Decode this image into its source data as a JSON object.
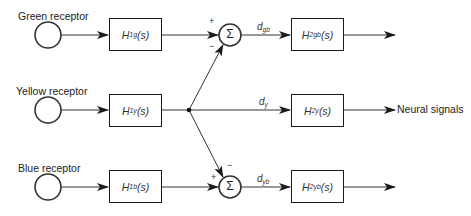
{
  "diagram": {
    "type": "block-diagram",
    "receptors": [
      {
        "label": "Green receptor"
      },
      {
        "label": "Yellow receptor"
      },
      {
        "label": "Blue receptor"
      }
    ],
    "stage1_blocks": [
      {
        "symbol": "H",
        "sub": "1g",
        "arg": "(s)"
      },
      {
        "symbol": "H",
        "sub": "1y",
        "arg": "(s)"
      },
      {
        "symbol": "H",
        "sub": "1b",
        "arg": "(s)"
      }
    ],
    "summing_junctions": [
      {
        "symbol": "Σ",
        "plus": "+",
        "minus": "−"
      },
      {
        "symbol": "Σ",
        "plus": "+",
        "minus": "−"
      }
    ],
    "signals": [
      {
        "symbol": "d",
        "sub": "gb"
      },
      {
        "symbol": "d",
        "sub": "y"
      },
      {
        "symbol": "d",
        "sub": "yb"
      }
    ],
    "stage2_blocks": [
      {
        "symbol": "H",
        "sub": "2gb",
        "arg": "(s)"
      },
      {
        "symbol": "H",
        "sub": "2y",
        "arg": "(s)"
      },
      {
        "symbol": "H",
        "sub": "2yb",
        "arg": "(s)"
      }
    ],
    "output_label": "Neural signals"
  }
}
